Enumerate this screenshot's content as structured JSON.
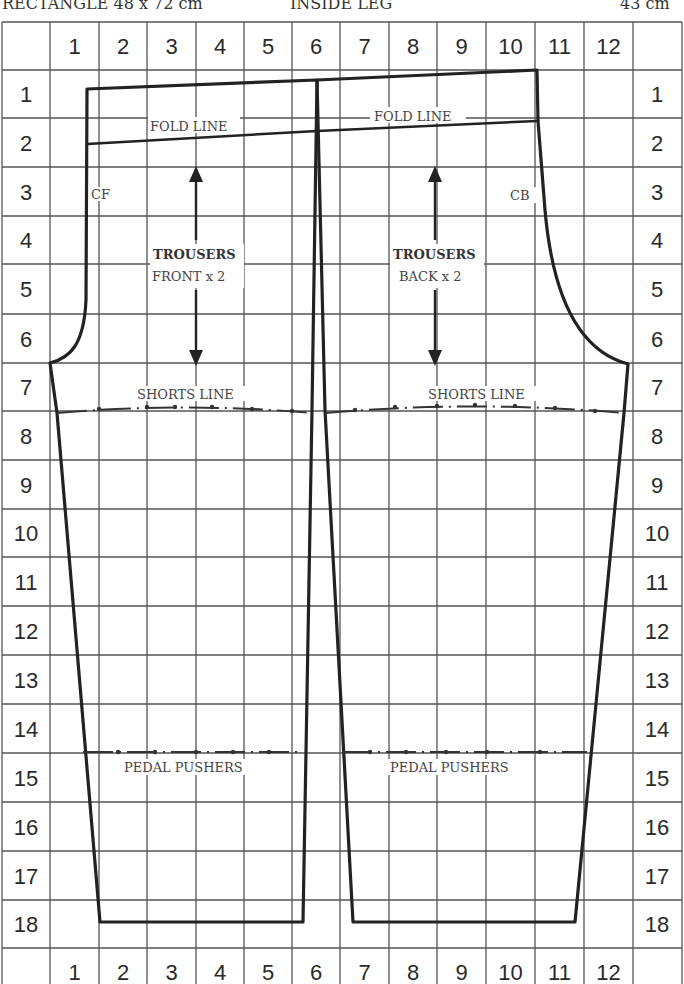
{
  "header": {
    "rectangle": "RECTANGLE 48 x 72 cm",
    "inside_leg_label": "INSIDE LEG",
    "inside_leg_value": "43 cm"
  },
  "grid": {
    "column_labels": [
      "1",
      "2",
      "3",
      "4",
      "5",
      "6",
      "7",
      "8",
      "9",
      "10",
      "11",
      "12"
    ],
    "row_labels": [
      "1",
      "2",
      "3",
      "4",
      "5",
      "6",
      "7",
      "8",
      "9",
      "10",
      "11",
      "12",
      "13",
      "14",
      "15",
      "16",
      "17",
      "18"
    ]
  },
  "pieces": {
    "front": {
      "title": "TROUSERS",
      "subtitle": "FRONT x 2",
      "center_mark": "CF",
      "fold_line": "FOLD LINE",
      "shorts_line": "SHORTS LINE",
      "pedal_pushers": "PEDAL PUSHERS"
    },
    "back": {
      "title": "TROUSERS",
      "subtitle": "BACK x 2",
      "center_mark": "CB",
      "fold_line": "FOLD LINE",
      "shorts_line": "SHORTS LINE",
      "pedal_pushers": "PEDAL PUSHERS"
    }
  },
  "colors": {
    "ink": "#222222",
    "grid": "#555555",
    "paper": "#ffffff"
  }
}
